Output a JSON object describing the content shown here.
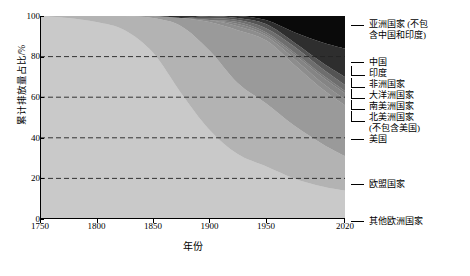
{
  "chart_data": {
    "type": "area",
    "stacked": true,
    "title": "",
    "xlabel": "年份",
    "ylabel": "累计排放量占比/%",
    "xlim": [
      1750,
      2020
    ],
    "ylim": [
      0,
      100
    ],
    "xticks": [
      1750,
      1800,
      1850,
      1900,
      1950,
      2020
    ],
    "yticks": [
      0,
      20,
      40,
      60,
      80,
      100
    ],
    "grid": "horizontal-dashed",
    "legend_position": "right",
    "x": [
      1750,
      1775,
      1800,
      1825,
      1850,
      1875,
      1900,
      1925,
      1950,
      1975,
      2000,
      2020
    ],
    "series": [
      {
        "name": "其他欧洲国家",
        "color": "#c9c9c9",
        "values": [
          100,
          99,
          97,
          93,
          82,
          62,
          44,
          32,
          26,
          20,
          16,
          14
        ]
      },
      {
        "name": "欧盟国家",
        "color": "#b3b3b3",
        "values": [
          0,
          1,
          3,
          7,
          17,
          33,
          39,
          35,
          31,
          26,
          21,
          17
        ]
      },
      {
        "name": "美国",
        "color": "#9a9a9a",
        "values": [
          0,
          0,
          0,
          0,
          1,
          4,
          14,
          26,
          31,
          30,
          27,
          25
        ]
      },
      {
        "name": "北美洲国家(不包含美国)",
        "color": "#8d8d8d",
        "values": [
          0,
          0,
          0,
          0,
          0,
          0,
          1,
          2,
          2,
          3,
          3,
          3
        ]
      },
      {
        "name": "南美洲国家",
        "color": "#848484",
        "values": [
          0,
          0,
          0,
          0,
          0,
          0,
          0,
          1,
          1,
          2,
          3,
          3
        ]
      },
      {
        "name": "大洋洲国家",
        "color": "#7a7a7a",
        "values": [
          0,
          0,
          0,
          0,
          0,
          0,
          0,
          1,
          1,
          1,
          1,
          1
        ]
      },
      {
        "name": "非洲国家",
        "color": "#6e6e6e",
        "values": [
          0,
          0,
          0,
          0,
          0,
          0,
          1,
          1,
          2,
          3,
          3,
          3
        ]
      },
      {
        "name": "印度",
        "color": "#545454",
        "values": [
          0,
          0,
          0,
          0,
          0,
          0,
          1,
          1,
          2,
          2,
          3,
          4
        ]
      },
      {
        "name": "中国",
        "color": "#2e2e2e",
        "values": [
          0,
          0,
          0,
          0,
          0,
          1,
          0,
          1,
          2,
          5,
          10,
          14
        ]
      },
      {
        "name": "亚洲国家(不包含中国和印度)",
        "color": "#0a0a0a",
        "values": [
          0,
          0,
          0,
          0,
          0,
          0,
          0,
          0,
          2,
          8,
          13,
          16
        ]
      }
    ]
  },
  "axes": {
    "ylabel": "累计排放量占比/%",
    "xlabel": "年份",
    "yticks": [
      "100",
      "80",
      "60",
      "40",
      "20",
      "0"
    ],
    "xticks": [
      "1750",
      "1800",
      "1850",
      "1900",
      "1950",
      "2020"
    ]
  },
  "legend": {
    "items": [
      {
        "label": "亚洲国家 (不包\n含中国和印度)"
      },
      {
        "label": "中国"
      },
      {
        "label": "印度"
      },
      {
        "label": "非洲国家"
      },
      {
        "label": "大洋洲国家"
      },
      {
        "label": "南美洲国家"
      },
      {
        "label": "北美洲国家\n(不包含美国)"
      },
      {
        "label": "美国"
      },
      {
        "label": "欧盟国家"
      },
      {
        "label": "其他欧洲国家"
      }
    ]
  }
}
